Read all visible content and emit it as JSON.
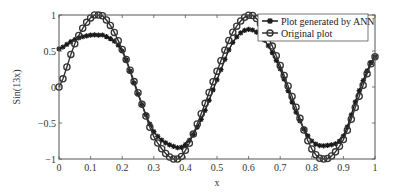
{
  "chart_data": {
    "type": "line",
    "title": "",
    "xlabel": "x",
    "ylabel": "Sin(13x)",
    "xlim": [
      0,
      1
    ],
    "ylim": [
      -1,
      1
    ],
    "grid": false,
    "legend_position": "upper right",
    "x_ticks": [
      "0",
      "0.1",
      "0.2",
      "0.3",
      "0.4",
      "0.5",
      "0.6",
      "0.7",
      "0.8",
      "0.9",
      "1"
    ],
    "y_ticks": [
      "−1",
      "−0.5",
      "0",
      "0.5",
      "1"
    ],
    "x_tick_values": [
      0,
      0.1,
      0.2,
      0.3,
      0.4,
      0.5,
      0.6,
      0.7,
      0.8,
      0.9,
      1.0
    ],
    "y_tick_values": [
      -1,
      -0.5,
      0,
      0.5,
      1
    ],
    "series": [
      {
        "name": "Plot generated by ANN",
        "marker": "star",
        "color": "#1a1a1a",
        "x": [
          0,
          0.05,
          0.1,
          0.12,
          0.15,
          0.2,
          0.25,
          0.3,
          0.36,
          0.4,
          0.45,
          0.5,
          0.55,
          0.6,
          0.65,
          0.7,
          0.75,
          0.8,
          0.85,
          0.9,
          0.95,
          1.0
        ],
        "values": [
          0.53,
          0.66,
          0.72,
          0.72,
          0.7,
          0.5,
          -0.1,
          -0.62,
          -0.82,
          -0.8,
          -0.45,
          0.1,
          0.62,
          0.8,
          0.65,
          0.25,
          -0.35,
          -0.75,
          -0.81,
          -0.68,
          -0.05,
          0.42
        ]
      },
      {
        "name": "Original plot",
        "marker": "circle",
        "color": "#333333",
        "x": [
          0,
          0.05,
          0.1,
          0.121,
          0.15,
          0.2,
          0.25,
          0.3,
          0.362,
          0.4,
          0.45,
          0.5,
          0.55,
          0.604,
          0.65,
          0.7,
          0.75,
          0.8,
          0.846,
          0.9,
          0.95,
          1.0
        ],
        "values": [
          0.0,
          0.6,
          0.96,
          1.0,
          0.93,
          0.52,
          -0.08,
          -0.69,
          -1.0,
          -0.88,
          -0.37,
          0.22,
          0.76,
          1.0,
          0.79,
          0.3,
          -0.28,
          -0.86,
          -1.0,
          -0.73,
          -0.13,
          0.42
        ]
      }
    ]
  },
  "legend": {
    "items": [
      {
        "label": "Plot generated by ANN",
        "marker": "star"
      },
      {
        "label": "Original plot",
        "marker": "circle"
      }
    ]
  },
  "axes": {
    "xlabel": "x",
    "ylabel": "Sin(13x)"
  }
}
